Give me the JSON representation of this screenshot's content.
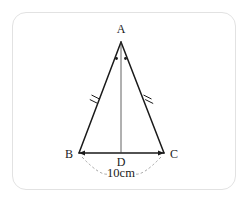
{
  "figure": {
    "type": "geometry-diagram",
    "shape": "isosceles-triangle",
    "background_color": "#ffffff",
    "border_color": "#e2e2e2",
    "stroke_color": "#1a1a1a",
    "dashed_color": "#9a9a9a",
    "vertices": {
      "A": {
        "label": "A",
        "x": 121,
        "y": 42,
        "label_x": 121,
        "label_y": 33
      },
      "B": {
        "label": "B",
        "x": 79,
        "y": 153,
        "label_x": 69,
        "label_y": 158
      },
      "C": {
        "label": "C",
        "x": 164,
        "y": 153,
        "label_x": 174,
        "label_y": 158
      },
      "D": {
        "label": "D",
        "x": 121,
        "y": 153,
        "label_x": 121,
        "label_y": 166
      }
    },
    "segments": [
      {
        "name": "side-AB",
        "from": "A",
        "to": "B"
      },
      {
        "name": "side-AC",
        "from": "A",
        "to": "C"
      },
      {
        "name": "base-BC",
        "from": "B",
        "to": "C"
      },
      {
        "name": "median-AD",
        "from": "A",
        "to": "D"
      }
    ],
    "congruence_marks": {
      "count_per_side": 2,
      "sides": [
        "AB",
        "AC"
      ]
    },
    "angle_marks": {
      "vertex": "A",
      "style": "dot",
      "count": 2
    },
    "dimension": {
      "label": "10cm",
      "value": 10,
      "unit": "cm",
      "measures": "BC",
      "label_x": 121,
      "label_y": 176,
      "style": "dashed-arc-with-arrows"
    }
  }
}
